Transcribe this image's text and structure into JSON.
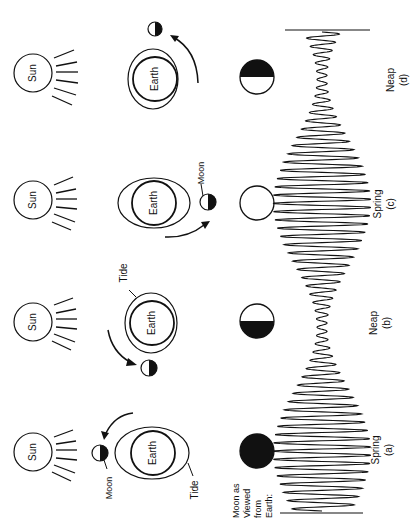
{
  "figure": {
    "orientation": "rotated-90-ccw",
    "colors": {
      "ink": "#111111",
      "background": "#ffffff"
    }
  },
  "panels": [
    {
      "id": "a",
      "sun_label": "Sun",
      "earth_label": "Earth",
      "moon_label": "Moon",
      "tide_label": "Tide",
      "moon_phase": "new",
      "tide_type": "Spring",
      "panel_letter": "(a)"
    },
    {
      "id": "b",
      "sun_label": "Sun",
      "earth_label": "Earth",
      "tide_label": "Tide",
      "moon_phase": "first-quarter",
      "tide_type": "Neap",
      "panel_letter": "(b)"
    },
    {
      "id": "c",
      "sun_label": "Sun",
      "earth_label": "Earth",
      "moon_label": "Moon",
      "moon_phase": "full",
      "tide_type": "Spring",
      "panel_letter": "(c)"
    },
    {
      "id": "d",
      "sun_label": "Sun",
      "earth_label": "Earth",
      "moon_phase": "third-quarter",
      "tide_type": "Neap",
      "panel_letter": "(d)"
    }
  ],
  "row_label": {
    "line1": "Moon as",
    "line2": "Viewed",
    "line3": "from",
    "line4": "Earth:"
  },
  "tide_curve": {
    "cycles": 58,
    "envelope": "spring-max at (a) and (c), neap-min at (b) and (d)"
  }
}
